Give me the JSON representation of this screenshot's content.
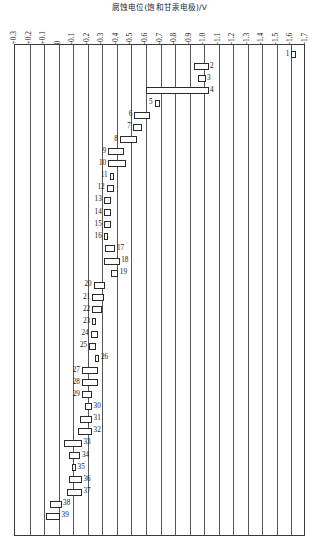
{
  "chart_data": {
    "type": "bar",
    "orientation": "horizontal",
    "title": "腐蚀电位(饱和甘汞电极)/V",
    "xlabel": "腐蚀电位(饱和甘汞电极)/V",
    "ylabel": "",
    "xlim": [
      0.3,
      -1.7
    ],
    "axis_position": "top",
    "grid": true,
    "legend": null,
    "xticks": [
      "+0.3",
      "+0.2",
      "+0.1",
      "0",
      "-0.1",
      "-0.2",
      "-0.3",
      "-0.4",
      "-0.5",
      "-0.6",
      "-0.7",
      "-0.8",
      "-0.9",
      "-1.0",
      "-1.1",
      "-1.2",
      "-1.3",
      "-1.4",
      "-1.5",
      "-1.6",
      "-1.7"
    ],
    "xtick_values": [
      0.3,
      0.2,
      0.1,
      0.0,
      -0.1,
      -0.2,
      -0.3,
      -0.4,
      -0.5,
      -0.6,
      -0.7,
      -0.8,
      -0.9,
      -1.0,
      -1.1,
      -1.2,
      -1.3,
      -1.4,
      -1.5,
      -1.6,
      -1.7
    ],
    "bars": [
      {
        "id": "1",
        "start": -1.6,
        "end": -1.63,
        "label_side": "left"
      },
      {
        "id": "2",
        "start": -0.93,
        "end": -1.03,
        "label_side": "right"
      },
      {
        "id": "3",
        "start": -0.96,
        "end": -1.01,
        "label_side": "right"
      },
      {
        "id": "4",
        "start": -0.6,
        "end": -1.03,
        "label_side": "right"
      },
      {
        "id": "5",
        "start": -0.66,
        "end": -0.7,
        "label_side": "left"
      },
      {
        "id": "6",
        "start": -0.52,
        "end": -0.63,
        "label_side": "left"
      },
      {
        "id": "7",
        "start": -0.51,
        "end": -0.57,
        "label_side": "left"
      },
      {
        "id": "8",
        "start": -0.42,
        "end": -0.54,
        "label_side": "left"
      },
      {
        "id": "9",
        "start": -0.34,
        "end": -0.45,
        "label_side": "left"
      },
      {
        "id": "10",
        "start": -0.34,
        "end": -0.46,
        "label_side": "left"
      },
      {
        "id": "11",
        "start": -0.35,
        "end": -0.38,
        "label_side": "left"
      },
      {
        "id": "12",
        "start": -0.33,
        "end": -0.38,
        "label_side": "left"
      },
      {
        "id": "13",
        "start": -0.31,
        "end": -0.36,
        "label_side": "left"
      },
      {
        "id": "14",
        "start": -0.31,
        "end": -0.36,
        "label_side": "left"
      },
      {
        "id": "15",
        "start": -0.31,
        "end": -0.36,
        "label_side": "left"
      },
      {
        "id": "16",
        "start": -0.31,
        "end": -0.34,
        "label_side": "left"
      },
      {
        "id": "17",
        "start": -0.32,
        "end": -0.39,
        "label_side": "right"
      },
      {
        "id": "18",
        "start": -0.31,
        "end": -0.42,
        "label_side": "right"
      },
      {
        "id": "19",
        "start": -0.36,
        "end": -0.41,
        "label_side": "right"
      },
      {
        "id": "20",
        "start": -0.24,
        "end": -0.32,
        "label_side": "left"
      },
      {
        "id": "21",
        "start": -0.23,
        "end": -0.31,
        "label_side": "left"
      },
      {
        "id": "22",
        "start": -0.23,
        "end": -0.3,
        "label_side": "left"
      },
      {
        "id": "23",
        "start": -0.23,
        "end": -0.26,
        "label_side": "left"
      },
      {
        "id": "24",
        "start": -0.22,
        "end": -0.27,
        "label_side": "left"
      },
      {
        "id": "25",
        "start": -0.21,
        "end": -0.26,
        "label_side": "left"
      },
      {
        "id": "26",
        "start": -0.25,
        "end": -0.28,
        "label_side": "right"
      },
      {
        "id": "27",
        "start": -0.16,
        "end": -0.27,
        "label_side": "left"
      },
      {
        "id": "28",
        "start": -0.16,
        "end": -0.27,
        "label_side": "left"
      },
      {
        "id": "29",
        "start": -0.16,
        "end": -0.23,
        "label_side": "left"
      },
      {
        "id": "30",
        "start": -0.18,
        "end": -0.23,
        "label_side": "right"
      },
      {
        "id": "31",
        "start": -0.15,
        "end": -0.23,
        "label_side": "right"
      },
      {
        "id": "32",
        "start": -0.13,
        "end": -0.23,
        "label_side": "right"
      },
      {
        "id": "33",
        "start": -0.04,
        "end": -0.16,
        "label_side": "right"
      },
      {
        "id": "34",
        "start": -0.07,
        "end": -0.15,
        "label_side": "right"
      },
      {
        "id": "35",
        "start": -0.09,
        "end": -0.12,
        "label_side": "right"
      },
      {
        "id": "36",
        "start": -0.07,
        "end": -0.16,
        "label_side": "right"
      },
      {
        "id": "37",
        "start": -0.06,
        "end": -0.16,
        "label_side": "right"
      },
      {
        "id": "38",
        "start": 0.06,
        "end": -0.02,
        "label_side": "right"
      },
      {
        "id": "39",
        "start": 0.09,
        "end": -0.01,
        "label_side": "right"
      }
    ]
  }
}
